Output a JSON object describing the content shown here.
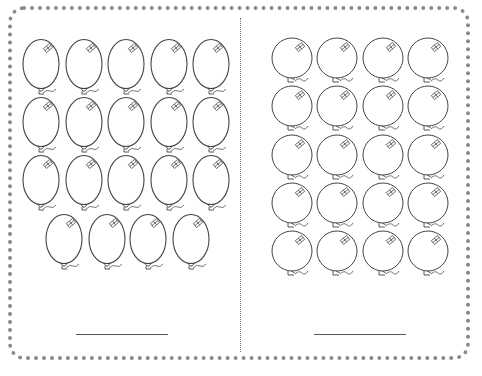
{
  "worksheet": {
    "type": "balloon counting worksheet",
    "left_panel": {
      "shape": "oval-balloon",
      "rows": [
        5,
        5,
        5,
        4
      ],
      "total": 19,
      "answer_line": {
        "x": 76,
        "y": 334,
        "width": 92
      }
    },
    "right_panel": {
      "shape": "round-balloon",
      "rows": [
        4,
        4,
        4,
        4,
        4
      ],
      "total": 20,
      "answer_line": {
        "x": 314,
        "y": 334,
        "width": 92
      }
    },
    "colors": {
      "outline": "#444444",
      "border": "#8a8a8a",
      "background": "#ffffff"
    }
  }
}
